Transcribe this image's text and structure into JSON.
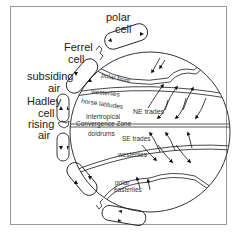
{
  "diagram": {
    "cells": [
      {
        "label": "polar cell"
      },
      {
        "label": "Ferrel cell"
      },
      {
        "label": "Hadley cell"
      }
    ],
    "air": [
      {
        "label": "subsiding air"
      },
      {
        "label": "rising air"
      }
    ],
    "belts": {
      "polar_front": "polar front",
      "westerlies_n": "westerlies",
      "horse_latitudes": "horse latitudes",
      "ne_trades": "NE trades",
      "itcz_line1": "Intertropical",
      "itcz_line2": "Convergence Zone",
      "doldrums": "doldrums",
      "se_trades": "SE trades",
      "westerlies_s": "westerlies",
      "polar_easterlies_line1": "polar",
      "polar_easterlies_line2": "easterlies"
    },
    "labels": {
      "polar": "polar",
      "cell1": "cell",
      "ferrel": "Ferrel",
      "cell2": "cell",
      "subsiding": "subsiding",
      "air1": "air",
      "hadley": "Hadley",
      "cell3": "cell",
      "rising": "rising",
      "air2": "air"
    }
  }
}
